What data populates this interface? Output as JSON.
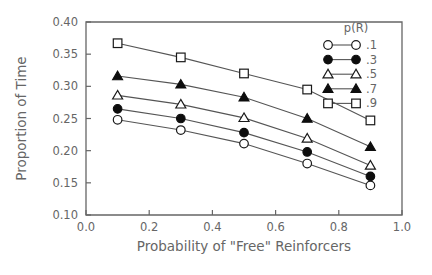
{
  "chart_data": {
    "type": "line",
    "title": "",
    "xlabel": "Probability of \"Free\" Reinforcers",
    "ylabel": "Proportion of Time",
    "xlim": [
      0.0,
      1.0
    ],
    "ylim": [
      0.1,
      0.4
    ],
    "xticks": [
      "0.0",
      "0.2",
      "0.4",
      "0.6",
      "0.8",
      "1.0"
    ],
    "xtick_values": [
      0.0,
      0.2,
      0.4,
      0.6,
      0.8,
      1.0
    ],
    "yticks": [
      "0.10",
      "0.15",
      "0.20",
      "0.25",
      "0.30",
      "0.35",
      "0.40"
    ],
    "ytick_values": [
      0.1,
      0.15,
      0.2,
      0.25,
      0.3,
      0.35,
      0.4
    ],
    "grid": false,
    "legend_position": "top-right",
    "legend_title": "p(R)",
    "x": [
      0.1,
      0.3,
      0.5,
      0.7,
      0.9
    ],
    "series": [
      {
        "name": ".1",
        "marker": "open-circle",
        "values": [
          0.248,
          0.232,
          0.211,
          0.18,
          0.146
        ]
      },
      {
        "name": ".3",
        "marker": "filled-circle",
        "values": [
          0.265,
          0.25,
          0.228,
          0.198,
          0.16
        ]
      },
      {
        "name": ".5",
        "marker": "open-triangle",
        "values": [
          0.286,
          0.272,
          0.251,
          0.219,
          0.177
        ]
      },
      {
        "name": ".7",
        "marker": "filled-triangle",
        "values": [
          0.316,
          0.303,
          0.283,
          0.25,
          0.206
        ]
      },
      {
        "name": ".9",
        "marker": "open-square",
        "values": [
          0.367,
          0.345,
          0.32,
          0.295,
          0.247
        ]
      }
    ]
  }
}
